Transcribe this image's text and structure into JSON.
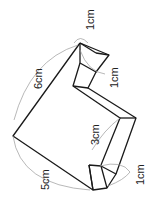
{
  "figure": {
    "type": "3d-solid-dimension-diagram",
    "labels": {
      "top_thickness": "1cm",
      "upper_notch": "1cm",
      "long_edge": "6cm",
      "middle_edge": "3cm",
      "short_edge": "5cm",
      "bottom_notch": "1cm"
    },
    "colors": {
      "edges": "#1a1a1a",
      "guides": "#9a9a9a",
      "background": "#ffffff"
    }
  }
}
